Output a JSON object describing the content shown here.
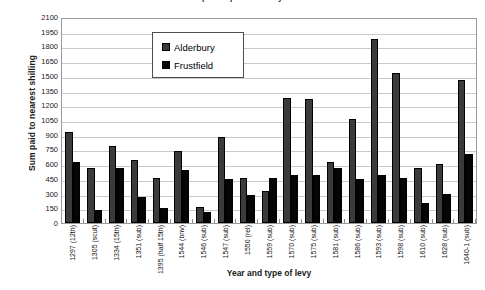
{
  "chart_data": {
    "type": "bar",
    "title": "Sums paid in parliamentary levies",
    "xlabel": "Year and type of levy",
    "ylabel": "Sum paid to nearest shilling",
    "ylim": [
      0,
      2100
    ],
    "ytick_step": 150,
    "yticks": [
      2100,
      1950,
      1800,
      1650,
      1500,
      1350,
      1200,
      1050,
      900,
      750,
      600,
      450,
      300,
      150,
      0
    ],
    "grid": true,
    "legend_position": "top-center-inside",
    "categories": [
      "1297 (12th)",
      "1305 (scut)",
      "1334 (15th)",
      "1351 (sub)",
      "1395 (half 15th)",
      "1544 (bnv)",
      "1546 (sub)",
      "1547 (sub)",
      "1550 (rel)",
      "1559 (sub)",
      "1570 (sub)",
      "1575 (sub)",
      "1581 (sub)",
      "1586 (sub)",
      "1593 (sub)",
      "1598 (sub)",
      "1610 (sub)",
      "1628 (sub)",
      "1640-1 (sub)"
    ],
    "series": [
      {
        "name": "Alderbury",
        "color": "#3b3b3b",
        "values": [
          930,
          560,
          790,
          640,
          460,
          730,
          160,
          880,
          460,
          330,
          1270,
          1260,
          620,
          1060,
          1880,
          1530,
          560,
          600,
          1460
        ]
      },
      {
        "name": "Frustfield",
        "color": "#050505",
        "values": [
          620,
          130,
          560,
          270,
          150,
          540,
          110,
          450,
          290,
          460,
          490,
          490,
          560,
          450,
          490,
          460,
          200,
          300,
          700
        ]
      }
    ]
  },
  "legend": {
    "items": [
      {
        "label": "Alderbury"
      },
      {
        "label": "Frustfield"
      }
    ]
  }
}
